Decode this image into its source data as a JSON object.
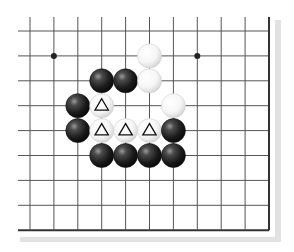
{
  "diagram": {
    "type": "go-board-fragment",
    "columns": 11,
    "rows": 9,
    "open_edges": [
      "top",
      "left"
    ],
    "closed_edges": [
      "right",
      "bottom"
    ],
    "grid": {
      "x0": 30,
      "dx": 23.9,
      "y0": 31,
      "dy": 24.9,
      "open_extend": 12
    },
    "colors": {
      "line": "#555555",
      "edge": "#333333",
      "shadow": "#e2e2e2",
      "black_stone": "#1a1a1a",
      "white_stone": "#ffffff"
    },
    "star_points": [
      {
        "col": 1,
        "row": 1
      },
      {
        "col": 7,
        "row": 1
      }
    ],
    "stones": [
      {
        "color": "white",
        "col": 5,
        "row": 1,
        "mark": ""
      },
      {
        "color": "black",
        "col": 3,
        "row": 2,
        "mark": ""
      },
      {
        "color": "black",
        "col": 4,
        "row": 2,
        "mark": ""
      },
      {
        "color": "white",
        "col": 5,
        "row": 2,
        "mark": ""
      },
      {
        "color": "black",
        "col": 2,
        "row": 3,
        "mark": ""
      },
      {
        "color": "white",
        "col": 3,
        "row": 3,
        "mark": "triangle"
      },
      {
        "color": "white",
        "col": 6,
        "row": 3,
        "mark": ""
      },
      {
        "color": "black",
        "col": 2,
        "row": 4,
        "mark": ""
      },
      {
        "color": "white",
        "col": 3,
        "row": 4,
        "mark": "triangle"
      },
      {
        "color": "white",
        "col": 4,
        "row": 4,
        "mark": "triangle"
      },
      {
        "color": "white",
        "col": 5,
        "row": 4,
        "mark": "triangle"
      },
      {
        "color": "black",
        "col": 6,
        "row": 4,
        "mark": ""
      },
      {
        "color": "black",
        "col": 3,
        "row": 5,
        "mark": ""
      },
      {
        "color": "black",
        "col": 4,
        "row": 5,
        "mark": ""
      },
      {
        "color": "black",
        "col": 5,
        "row": 5,
        "mark": ""
      },
      {
        "color": "black",
        "col": 6,
        "row": 5,
        "mark": ""
      }
    ],
    "marked_stone_count": 4,
    "mark_symbol": "triangle"
  }
}
